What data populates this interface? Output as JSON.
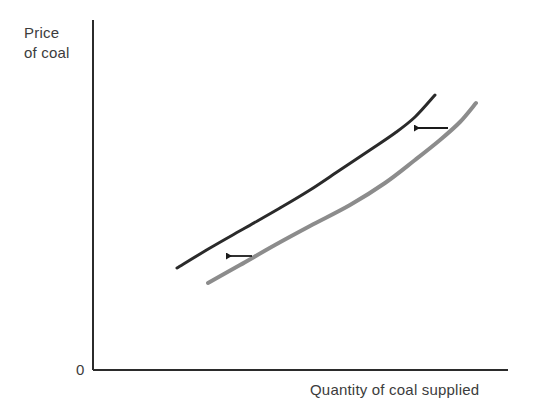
{
  "figure": {
    "background_color": "#ffffff",
    "axis_color": "#2b2b2b",
    "text_color": "#3c3c3c",
    "origin_label": "0",
    "y_axis_label_line1": "Price",
    "y_axis_label_line2": "of coal",
    "x_axis_label": "Quantity of coal supplied"
  },
  "chart_data": {
    "type": "line",
    "title": "",
    "xlabel": "Quantity of coal supplied",
    "ylabel": "Price of coal",
    "grid": false,
    "legend": "none",
    "axes": {
      "origin_label": "0",
      "x_axis_y_px": 370,
      "y_axis_x_px": 93,
      "y_axis_top_px": 20,
      "x_axis_right_px": 508,
      "ticks": [],
      "tick_labels": []
    },
    "series": [
      {
        "name": "new-supply-curve",
        "color": "#2a2a2a",
        "width": 3,
        "role": "shifted-supply-curve",
        "points": [
          [
            177,
            268
          ],
          [
            210,
            248
          ],
          [
            245,
            228
          ],
          [
            280,
            208
          ],
          [
            310,
            190
          ],
          [
            340,
            170
          ],
          [
            370,
            150
          ],
          [
            395,
            133
          ],
          [
            415,
            117
          ],
          [
            435,
            95
          ]
        ]
      },
      {
        "name": "original-supply-curve",
        "color": "#8c8c8c",
        "width": 4,
        "role": "original-supply-curve",
        "points": [
          [
            208,
            283
          ],
          [
            240,
            265
          ],
          [
            275,
            245
          ],
          [
            310,
            226
          ],
          [
            350,
            205
          ],
          [
            385,
            183
          ],
          [
            415,
            160
          ],
          [
            440,
            140
          ],
          [
            460,
            122
          ],
          [
            476,
            103
          ]
        ]
      }
    ],
    "annotations": [
      {
        "name": "upper-shift-arrow",
        "type": "arrow",
        "direction": "left",
        "color": "#1a1a1a",
        "from": [
          448,
          128
        ],
        "to": [
          409,
          128
        ]
      },
      {
        "name": "lower-shift-arrow",
        "type": "arrow",
        "direction": "left",
        "color": "#1a1a1a",
        "from": [
          252,
          256
        ],
        "to": [
          221,
          256
        ]
      }
    ]
  }
}
